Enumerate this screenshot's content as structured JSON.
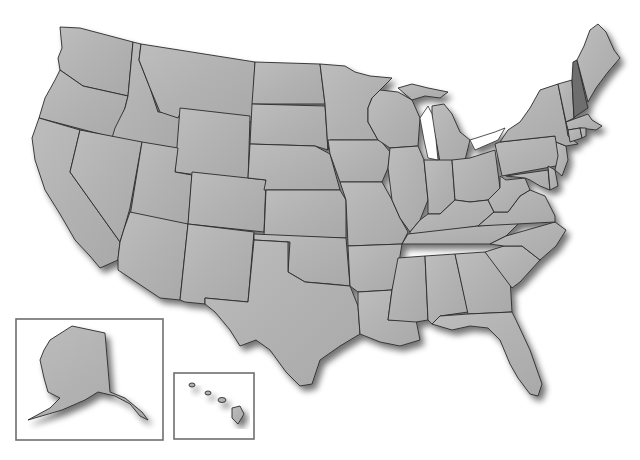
{
  "map": {
    "title": "United States",
    "colors": {
      "state_fill": "#b4b4b4",
      "highlight_fill": "#6e6e6e",
      "border": "#2a2a2a",
      "inset_frame": "#6e6e6e",
      "background": "#ffffff"
    },
    "highlighted_state": "New Hampshire",
    "insets": [
      {
        "name": "Alaska"
      },
      {
        "name": "Hawaii"
      }
    ]
  }
}
